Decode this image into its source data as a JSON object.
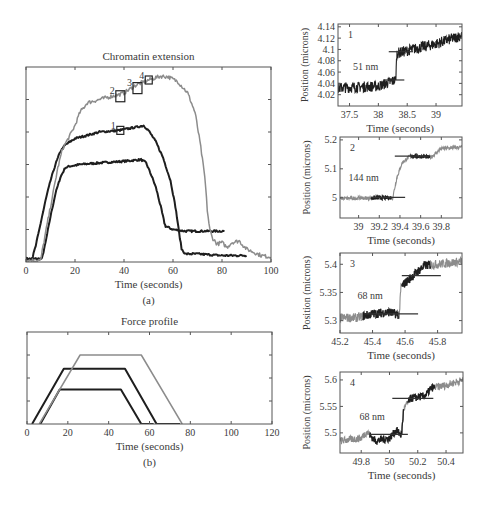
{
  "chart_data": [
    {
      "id": "a",
      "type": "line",
      "title": "Chromatin extension",
      "panel_label": "(a)",
      "xlabel": "Time (seconds)",
      "ylabel": "",
      "xlim": [
        0,
        100
      ],
      "ylim": [
        0,
        6
      ],
      "xticks": [
        0,
        20,
        40,
        60,
        80,
        100
      ],
      "yticks_count": 6,
      "grid": false,
      "series": [
        {
          "name": "low-force trace",
          "color": "#1e1e1e",
          "width": 2,
          "points": [
            [
              0,
              0.1
            ],
            [
              5,
              0.1
            ],
            [
              6.5,
              0.1
            ],
            [
              8,
              0.6
            ],
            [
              10,
              1.4
            ],
            [
              12,
              2.1
            ],
            [
              14,
              2.6
            ],
            [
              16,
              2.9
            ],
            [
              18,
              2.95
            ],
            [
              22,
              3.0
            ],
            [
              30,
              3.05
            ],
            [
              40,
              3.1
            ],
            [
              47,
              3.15
            ],
            [
              49,
              3.05
            ],
            [
              51,
              2.7
            ],
            [
              53,
              2.3
            ],
            [
              55,
              1.7
            ],
            [
              56.5,
              1.2
            ],
            [
              57,
              1.1
            ],
            [
              60,
              1.0
            ],
            [
              65,
              0.95
            ],
            [
              70,
              0.95
            ],
            [
              75,
              0.95
            ],
            [
              80,
              0.95
            ],
            [
              81,
              0.95
            ]
          ]
        },
        {
          "name": "mid-force trace",
          "color": "#1e1e1e",
          "width": 2,
          "points": [
            [
              0,
              0.1
            ],
            [
              2.5,
              0.1
            ],
            [
              4,
              0.5
            ],
            [
              6,
              1.2
            ],
            [
              8,
              1.9
            ],
            [
              10,
              2.5
            ],
            [
              12,
              3.0
            ],
            [
              14,
              3.4
            ],
            [
              16,
              3.6
            ],
            [
              20,
              3.8
            ],
            [
              30,
              4.0
            ],
            [
              38,
              4.05
            ],
            [
              45,
              4.15
            ],
            [
              48,
              4.2
            ],
            [
              50,
              4.05
            ],
            [
              53,
              3.7
            ],
            [
              56,
              3.2
            ],
            [
              59,
              2.5
            ],
            [
              61,
              1.7
            ],
            [
              62.5,
              0.9
            ],
            [
              63.5,
              0.4
            ],
            [
              65,
              0.25
            ],
            [
              70,
              0.25
            ],
            [
              80,
              0.2
            ],
            [
              90,
              0.2
            ]
          ]
        },
        {
          "name": "high-force trace",
          "color": "#8c8c8c",
          "width": 1.5,
          "points": [
            [
              0,
              0.05
            ],
            [
              6,
              0.05
            ],
            [
              7,
              0.5
            ],
            [
              9,
              1.3
            ],
            [
              11,
              2.1
            ],
            [
              13,
              2.9
            ],
            [
              15,
              3.5
            ],
            [
              18,
              3.9
            ],
            [
              20,
              4.2
            ],
            [
              22,
              4.6
            ],
            [
              25,
              4.9
            ],
            [
              30,
              5.0
            ],
            [
              35,
              5.1
            ],
            [
              38,
              5.15
            ],
            [
              40,
              5.2
            ],
            [
              43,
              5.35
            ],
            [
              45,
              5.45
            ],
            [
              50,
              5.6
            ],
            [
              55,
              5.72
            ],
            [
              58,
              5.7
            ],
            [
              62,
              5.55
            ],
            [
              66,
              5.2
            ],
            [
              69,
              4.6
            ],
            [
              71,
              3.7
            ],
            [
              73,
              2.6
            ],
            [
              74,
              1.6
            ],
            [
              75,
              1.0
            ],
            [
              76,
              0.75
            ],
            [
              78,
              0.55
            ],
            [
              80,
              0.6
            ],
            [
              82,
              0.45
            ],
            [
              84,
              0.6
            ],
            [
              87,
              0.65
            ],
            [
              90,
              0.4
            ],
            [
              93,
              0.3
            ],
            [
              96,
              0.2
            ],
            [
              100,
              0.15
            ]
          ]
        }
      ],
      "annotations": [
        {
          "label": "1",
          "x": 38.5,
          "y": 4.05,
          "series": "mid-force trace"
        },
        {
          "label": "2",
          "x": 38.5,
          "y": 5.1,
          "series": "high-force trace"
        },
        {
          "label": "3",
          "x": 45.5,
          "y": 5.35,
          "series": "high-force trace"
        },
        {
          "label": "4",
          "x": 50.1,
          "y": 5.6,
          "series": "high-force trace"
        }
      ]
    },
    {
      "id": "b",
      "type": "line",
      "title": "Force profile",
      "panel_label": "(b)",
      "xlabel": "Time (seconds)",
      "ylabel": "",
      "xlim": [
        0,
        120
      ],
      "ylim": [
        0,
        4
      ],
      "xticks": [
        0,
        20,
        40,
        60,
        80,
        100,
        120
      ],
      "yticks_count": 4,
      "grid": false,
      "series": [
        {
          "name": "low force",
          "color": "#1e1e1e",
          "width": 2,
          "points": [
            [
              6.5,
              0
            ],
            [
              16,
              1.5
            ],
            [
              46,
              1.5
            ],
            [
              56,
              0
            ],
            [
              62,
              0
            ]
          ]
        },
        {
          "name": "mid force",
          "color": "#1e1e1e",
          "width": 2,
          "points": [
            [
              2.5,
              0
            ],
            [
              18,
              2.4
            ],
            [
              48,
              2.4
            ],
            [
              63.5,
              0
            ],
            [
              75,
              0
            ]
          ]
        },
        {
          "name": "high force",
          "color": "#8c8c8c",
          "width": 1.5,
          "points": [
            [
              6,
              0
            ],
            [
              26,
              3.0
            ],
            [
              56,
              3.0
            ],
            [
              76,
              0
            ]
          ]
        }
      ]
    },
    {
      "id": "1",
      "type": "line",
      "panel_label": "1",
      "xlabel": "Time (seconds)",
      "ylabel": "Position (microns)",
      "xlim": [
        37.3,
        39.45
      ],
      "ylim": [
        4.0,
        4.145
      ],
      "xticks": [
        37.5,
        38,
        38.5,
        39
      ],
      "yticks": [
        4.02,
        4.04,
        4.06,
        4.08,
        4.1,
        4.12,
        4.14
      ],
      "step_label": "51 nm",
      "step": {
        "t": 38.3,
        "from": 4.045,
        "to": 4.096
      },
      "trace": {
        "start": 37.3,
        "end": 39.45,
        "levels": [
          [
            37.3,
            4.032
          ],
          [
            38.0,
            4.035
          ],
          [
            38.3,
            4.046
          ],
          [
            38.32,
            4.093
          ],
          [
            38.5,
            4.098
          ],
          [
            39.0,
            4.11
          ],
          [
            39.45,
            4.125
          ]
        ],
        "noise": 0.012,
        "color": "#1e1e1e"
      },
      "level_lines": [
        {
          "x1": 38.1,
          "x2": 38.45,
          "y": 4.046
        },
        {
          "x1": 38.18,
          "x2": 38.6,
          "y": 4.096
        }
      ]
    },
    {
      "id": "2",
      "type": "line",
      "panel_label": "2",
      "xlabel": "Time (seconds)",
      "ylabel": "Position (microns)",
      "xlim": [
        38.82,
        40.0
      ],
      "ylim": [
        4.93,
        5.21
      ],
      "xticks": [
        39,
        39.2,
        39.4,
        39.6,
        39.8
      ],
      "yticks": [
        5,
        5.1,
        5.2
      ],
      "step_label": "144 nm",
      "step": {
        "t": 39.34,
        "from": 5.0,
        "to": 5.144
      },
      "trace": {
        "levels": [
          [
            38.82,
            4.998
          ],
          [
            39.33,
            5.0
          ],
          [
            39.37,
            5.07
          ],
          [
            39.42,
            5.12
          ],
          [
            39.5,
            5.145
          ],
          [
            39.7,
            5.14
          ],
          [
            39.8,
            5.17
          ],
          [
            40.0,
            5.175
          ]
        ],
        "noise": 0.008,
        "color": "#8c8c8c"
      },
      "highlight_ranges": [
        [
          39.12,
          39.32
        ],
        [
          39.5,
          39.69
        ]
      ],
      "level_lines": [
        {
          "x1": 39.12,
          "x2": 39.45,
          "y": 5.001
        },
        {
          "x1": 39.35,
          "x2": 39.68,
          "y": 5.144
        }
      ]
    },
    {
      "id": "3",
      "type": "line",
      "panel_label": "3",
      "xlabel": "Time (seconds)",
      "ylabel": "Position (microns)",
      "xlim": [
        45.2,
        45.95
      ],
      "ylim": [
        5.278,
        5.42
      ],
      "xticks": [
        45.2,
        45.4,
        45.6,
        45.8
      ],
      "yticks": [
        5.3,
        5.35,
        5.4
      ],
      "step_label": "68 nm",
      "step": {
        "t": 45.57,
        "from": 5.312,
        "to": 5.38
      },
      "trace": {
        "levels": [
          [
            45.2,
            5.305
          ],
          [
            45.3,
            5.305
          ],
          [
            45.4,
            5.312
          ],
          [
            45.5,
            5.315
          ],
          [
            45.565,
            5.31
          ],
          [
            45.575,
            5.36
          ],
          [
            45.65,
            5.38
          ],
          [
            45.72,
            5.398
          ],
          [
            45.8,
            5.4
          ],
          [
            45.95,
            5.405
          ]
        ],
        "noise": 0.01,
        "color": "#8c8c8c"
      },
      "highlight_ranges": [
        [
          45.34,
          45.56
        ],
        [
          45.58,
          45.76
        ]
      ],
      "level_lines": [
        {
          "x1": 45.35,
          "x2": 45.68,
          "y": 5.312
        },
        {
          "x1": 45.58,
          "x2": 45.82,
          "y": 5.38
        }
      ]
    },
    {
      "id": "4",
      "type": "line",
      "panel_label": "4",
      "xlabel": "Time (seconds)",
      "ylabel": "Position (microns)",
      "xlim": [
        49.65,
        50.52
      ],
      "ylim": [
        5.462,
        5.615
      ],
      "xticks": [
        49.8,
        50,
        50.2,
        50.4
      ],
      "yticks": [
        5.5,
        5.55,
        5.6
      ],
      "step_label": "68 nm",
      "step": {
        "t": 50.09,
        "from": 5.497,
        "to": 5.565
      },
      "trace": {
        "levels": [
          [
            49.65,
            5.485
          ],
          [
            49.8,
            5.49
          ],
          [
            49.84,
            5.502
          ],
          [
            49.9,
            5.485
          ],
          [
            50.0,
            5.49
          ],
          [
            50.05,
            5.505
          ],
          [
            50.085,
            5.495
          ],
          [
            50.1,
            5.545
          ],
          [
            50.15,
            5.565
          ],
          [
            50.25,
            5.57
          ],
          [
            50.3,
            5.585
          ],
          [
            50.4,
            5.59
          ],
          [
            50.52,
            5.6
          ]
        ],
        "noise": 0.009,
        "color": "#8c8c8c"
      },
      "highlight_ranges": [
        [
          49.86,
          50.1
        ],
        [
          50.13,
          50.32
        ]
      ],
      "level_lines": [
        {
          "x1": 49.86,
          "x2": 50.13,
          "y": 5.497
        },
        {
          "x1": 50.02,
          "x2": 50.31,
          "y": 5.565
        }
      ]
    }
  ],
  "layout_frames": {
    "a": {
      "x": 26,
      "y": 67,
      "w": 245,
      "h": 195
    },
    "b": {
      "x": 27,
      "y": 332,
      "w": 245,
      "h": 92
    },
    "1": {
      "x": 338,
      "y": 24,
      "w": 124,
      "h": 82
    },
    "2": {
      "x": 340,
      "y": 137,
      "w": 122,
      "h": 81
    },
    "3": {
      "x": 340,
      "y": 253,
      "w": 122,
      "h": 80
    },
    "4": {
      "x": 340,
      "y": 372,
      "w": 123,
      "h": 81
    }
  },
  "colors": {
    "dark": "#1e1e1e",
    "gray": "#8c8c8c",
    "axis": "#555555",
    "text": "#3a3a3a"
  }
}
